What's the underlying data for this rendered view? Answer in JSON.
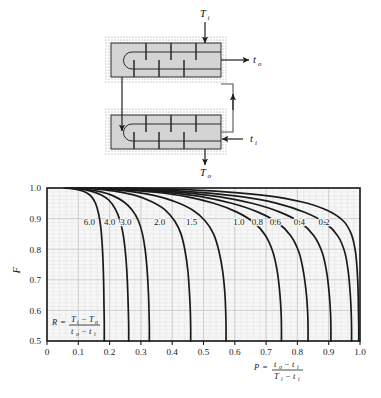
{
  "figure": {
    "kind": "lmtd-correction-factor-chart",
    "diagram": {
      "title_note": "",
      "labels": {
        "shell_inlet": "T",
        "shell_inlet_sub": "i",
        "shell_outlet": "T",
        "shell_outlet_sub": "o",
        "tube_outlet": "t",
        "tube_outlet_sub": "o",
        "tube_inlet": "t",
        "tube_inlet_sub": "i"
      },
      "colors": {
        "shell_fill": "#d4d4d4",
        "insulation_dots": "#9a9a9a",
        "outline": "#2a2a2a"
      },
      "shells": 2,
      "baffles_per_shell": 6
    }
  },
  "chart_data": {
    "type": "line",
    "title": "",
    "xlabel": "P",
    "ylabel": "F",
    "xlabel_formula": {
      "lhs": "P",
      "numerator": "t o  −  t i",
      "denominator": "T i  −  t i",
      "num_var1": "t",
      "num_sub1": "o",
      "num_var2": "t",
      "num_sub2": "i",
      "den_var1": "T",
      "den_sub1": "i",
      "den_var2": "t",
      "den_sub2": "i"
    },
    "inplot_formula": {
      "lhs": "R",
      "num_var1": "T",
      "num_sub1": "i",
      "num_var2": "T",
      "num_sub2": "o",
      "den_var1": "t",
      "den_sub1": "o",
      "den_var2": "t",
      "den_sub2": "i"
    },
    "xlim": [
      0,
      1.0
    ],
    "ylim": [
      0.5,
      1.0
    ],
    "xticks": [
      "0",
      "0.1",
      "0.2",
      "0.3",
      "0.4",
      "0.5",
      "0.6",
      "0.7",
      "0.8",
      "0.9",
      "1.0"
    ],
    "xtick_values": [
      0,
      0.1,
      0.2,
      0.3,
      0.4,
      0.5,
      0.6,
      0.7,
      0.8,
      0.9,
      1.0
    ],
    "yticks": [
      "0.5",
      "0.6",
      "0.7",
      "0.8",
      "0.9",
      "1.0"
    ],
    "ytick_values": [
      0.5,
      0.6,
      0.7,
      0.8,
      0.9,
      1.0
    ],
    "grid": true,
    "minor_grid_x_step": 0.02,
    "minor_grid_y_step": 0.0125,
    "legend_position": "inline-curve-labels",
    "series_parameter_name": "R",
    "series": [
      {
        "name": "6.0",
        "label": "6.0",
        "label_x": 0.135,
        "label_y": 0.878,
        "points": [
          [
            0.055,
            1.0
          ],
          [
            0.08,
            0.998
          ],
          [
            0.105,
            0.993
          ],
          [
            0.125,
            0.985
          ],
          [
            0.142,
            0.972
          ],
          [
            0.155,
            0.95
          ],
          [
            0.165,
            0.915
          ],
          [
            0.172,
            0.87
          ],
          [
            0.176,
            0.82
          ],
          [
            0.179,
            0.76
          ],
          [
            0.181,
            0.69
          ],
          [
            0.182,
            0.62
          ],
          [
            0.183,
            0.56
          ],
          [
            0.183,
            0.5
          ]
        ]
      },
      {
        "name": "4.0",
        "label": "4.0",
        "label_x": 0.2,
        "label_y": 0.878,
        "points": [
          [
            0.068,
            1.0
          ],
          [
            0.105,
            0.997
          ],
          [
            0.14,
            0.99
          ],
          [
            0.172,
            0.978
          ],
          [
            0.198,
            0.96
          ],
          [
            0.218,
            0.932
          ],
          [
            0.233,
            0.895
          ],
          [
            0.243,
            0.85
          ],
          [
            0.25,
            0.795
          ],
          [
            0.255,
            0.73
          ],
          [
            0.258,
            0.66
          ],
          [
            0.26,
            0.595
          ],
          [
            0.261,
            0.545
          ],
          [
            0.261,
            0.5
          ]
        ]
      },
      {
        "name": "3.0",
        "label": "3.0",
        "label_x": 0.252,
        "label_y": 0.878,
        "points": [
          [
            0.078,
            1.0
          ],
          [
            0.125,
            0.996
          ],
          [
            0.17,
            0.988
          ],
          [
            0.21,
            0.975
          ],
          [
            0.245,
            0.955
          ],
          [
            0.272,
            0.928
          ],
          [
            0.292,
            0.893
          ],
          [
            0.305,
            0.85
          ],
          [
            0.314,
            0.795
          ],
          [
            0.32,
            0.73
          ],
          [
            0.324,
            0.66
          ],
          [
            0.326,
            0.595
          ],
          [
            0.327,
            0.545
          ],
          [
            0.327,
            0.5
          ]
        ]
      },
      {
        "name": "2.0",
        "label": "2.0",
        "label_x": 0.36,
        "label_y": 0.878,
        "points": [
          [
            0.095,
            1.0
          ],
          [
            0.16,
            0.996
          ],
          [
            0.225,
            0.988
          ],
          [
            0.285,
            0.975
          ],
          [
            0.335,
            0.955
          ],
          [
            0.378,
            0.928
          ],
          [
            0.408,
            0.892
          ],
          [
            0.428,
            0.85
          ],
          [
            0.441,
            0.795
          ],
          [
            0.45,
            0.73
          ],
          [
            0.455,
            0.66
          ],
          [
            0.458,
            0.595
          ],
          [
            0.459,
            0.545
          ],
          [
            0.459,
            0.5
          ]
        ]
      },
      {
        "name": "1.5",
        "label": "1.5",
        "label_x": 0.462,
        "label_y": 0.878,
        "points": [
          [
            0.11,
            1.0
          ],
          [
            0.19,
            0.996
          ],
          [
            0.27,
            0.988
          ],
          [
            0.345,
            0.975
          ],
          [
            0.41,
            0.955
          ],
          [
            0.465,
            0.928
          ],
          [
            0.505,
            0.893
          ],
          [
            0.532,
            0.85
          ],
          [
            0.549,
            0.795
          ],
          [
            0.561,
            0.73
          ],
          [
            0.568,
            0.66
          ],
          [
            0.571,
            0.595
          ],
          [
            0.572,
            0.545
          ],
          [
            0.572,
            0.5
          ]
        ]
      },
      {
        "name": "1.0",
        "label": "1.0",
        "label_x": 0.613,
        "label_y": 0.878,
        "points": [
          [
            0.135,
            1.0
          ],
          [
            0.24,
            0.995
          ],
          [
            0.345,
            0.986
          ],
          [
            0.445,
            0.972
          ],
          [
            0.533,
            0.95
          ],
          [
            0.605,
            0.922
          ],
          [
            0.66,
            0.888
          ],
          [
            0.698,
            0.845
          ],
          [
            0.722,
            0.79
          ],
          [
            0.736,
            0.725
          ],
          [
            0.744,
            0.655
          ],
          [
            0.748,
            0.592
          ],
          [
            0.749,
            0.543
          ],
          [
            0.749,
            0.5
          ]
        ]
      },
      {
        "name": "0.8",
        "label": "0.8",
        "label_x": 0.672,
        "label_y": 0.878,
        "points": [
          [
            0.15,
            1.0
          ],
          [
            0.265,
            0.995
          ],
          [
            0.382,
            0.986
          ],
          [
            0.492,
            0.972
          ],
          [
            0.59,
            0.95
          ],
          [
            0.672,
            0.922
          ],
          [
            0.735,
            0.888
          ],
          [
            0.778,
            0.845
          ],
          [
            0.805,
            0.79
          ],
          [
            0.82,
            0.722
          ],
          [
            0.829,
            0.65
          ],
          [
            0.833,
            0.588
          ],
          [
            0.834,
            0.54
          ],
          [
            0.834,
            0.5
          ]
        ]
      },
      {
        "name": "0.6",
        "label": "0.6",
        "label_x": 0.73,
        "label_y": 0.878,
        "points": [
          [
            0.168,
            1.0
          ],
          [
            0.295,
            0.995
          ],
          [
            0.425,
            0.986
          ],
          [
            0.548,
            0.972
          ],
          [
            0.655,
            0.95
          ],
          [
            0.742,
            0.922
          ],
          [
            0.808,
            0.888
          ],
          [
            0.852,
            0.845
          ],
          [
            0.879,
            0.79
          ],
          [
            0.894,
            0.722
          ],
          [
            0.902,
            0.65
          ],
          [
            0.906,
            0.588
          ],
          [
            0.907,
            0.54
          ],
          [
            0.907,
            0.5
          ]
        ]
      },
      {
        "name": "0.4",
        "label": "0.4",
        "label_x": 0.806,
        "label_y": 0.878,
        "points": [
          [
            0.195,
            1.0
          ],
          [
            0.34,
            0.995
          ],
          [
            0.485,
            0.986
          ],
          [
            0.62,
            0.972
          ],
          [
            0.735,
            0.95
          ],
          [
            0.825,
            0.92
          ],
          [
            0.89,
            0.885
          ],
          [
            0.93,
            0.842
          ],
          [
            0.952,
            0.788
          ],
          [
            0.963,
            0.722
          ],
          [
            0.969,
            0.652
          ],
          [
            0.972,
            0.59
          ],
          [
            0.973,
            0.542
          ],
          [
            0.973,
            0.5
          ]
        ]
      },
      {
        "name": "0.2",
        "label": "0.2",
        "label_x": 0.885,
        "label_y": 0.878,
        "points": [
          [
            0.235,
            1.0
          ],
          [
            0.4,
            0.996
          ],
          [
            0.56,
            0.988
          ],
          [
            0.7,
            0.975
          ],
          [
            0.812,
            0.955
          ],
          [
            0.893,
            0.928
          ],
          [
            0.946,
            0.893
          ],
          [
            0.972,
            0.85
          ],
          [
            0.985,
            0.795
          ],
          [
            0.991,
            0.73
          ],
          [
            0.994,
            0.66
          ],
          [
            0.995,
            0.595
          ],
          [
            0.996,
            0.545
          ],
          [
            0.996,
            0.5
          ]
        ]
      }
    ],
    "colors": {
      "curve": "#1a1a1a",
      "plot_bg": "#f7f7f7",
      "major_grid": "#c9c9c9",
      "minor_grid": "#e2e2e2",
      "frame": "#1a1a1a"
    }
  }
}
